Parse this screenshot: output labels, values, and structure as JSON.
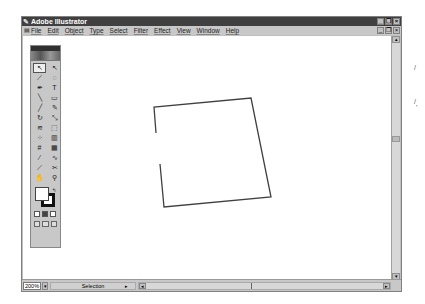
{
  "window": {
    "title": "Adobe Illustrator",
    "controls": [
      "_",
      "❐",
      "×"
    ]
  },
  "menubar": {
    "items": [
      "File",
      "Edit",
      "Object",
      "Type",
      "Select",
      "Filter",
      "Effect",
      "View",
      "Window",
      "Help"
    ],
    "doc_controls": [
      "_",
      "❐",
      "×"
    ]
  },
  "toolbox": {
    "tools": [
      {
        "name": "selection-tool",
        "glyph": "↖"
      },
      {
        "name": "direct-selection-tool",
        "glyph": "↖"
      },
      {
        "name": "magic-wand-tool",
        "glyph": "⟋"
      },
      {
        "name": "lasso-tool",
        "glyph": "◌"
      },
      {
        "name": "pen-tool",
        "glyph": "✒"
      },
      {
        "name": "type-tool",
        "glyph": "T"
      },
      {
        "name": "line-tool",
        "glyph": "╲"
      },
      {
        "name": "rectangle-tool",
        "glyph": "▭"
      },
      {
        "name": "paintbrush-tool",
        "glyph": "╱"
      },
      {
        "name": "pencil-tool",
        "glyph": "✎"
      },
      {
        "name": "rotate-tool",
        "glyph": "↻"
      },
      {
        "name": "scale-tool",
        "glyph": "⤡"
      },
      {
        "name": "warp-tool",
        "glyph": "≋"
      },
      {
        "name": "free-transform-tool",
        "glyph": "⬚"
      },
      {
        "name": "symbol-sprayer-tool",
        "glyph": "⁘"
      },
      {
        "name": "graph-tool",
        "glyph": "▥"
      },
      {
        "name": "mesh-tool",
        "glyph": "#"
      },
      {
        "name": "gradient-tool",
        "glyph": "▦"
      },
      {
        "name": "eyedropper-tool",
        "glyph": "⁄"
      },
      {
        "name": "blend-tool",
        "glyph": "∿"
      },
      {
        "name": "slice-tool",
        "glyph": "⟋"
      },
      {
        "name": "scissors-tool",
        "glyph": "✂"
      },
      {
        "name": "hand-tool",
        "glyph": "✋"
      },
      {
        "name": "zoom-tool",
        "glyph": "⚲"
      }
    ],
    "swap_glyph": "↰",
    "mode_buttons": [
      "color",
      "gradient",
      "none"
    ],
    "view_buttons": [
      "standard-screen",
      "full-screen-menu",
      "full-screen"
    ]
  },
  "canvas": {
    "path_points": "156,133 154,107 251,98 271,197 164,207 160,164",
    "stroke_color": "#404040"
  },
  "statusbar": {
    "zoom": "200%",
    "zoom_arrow": "▾",
    "status": "Selection",
    "status_arrow": "▸",
    "scroll_left": "◂",
    "scroll_right": "▸"
  },
  "vscroll": {
    "up": "▴",
    "down": "▾"
  },
  "outside": {
    "marks": [
      "/",
      "/",
      "'"
    ]
  }
}
